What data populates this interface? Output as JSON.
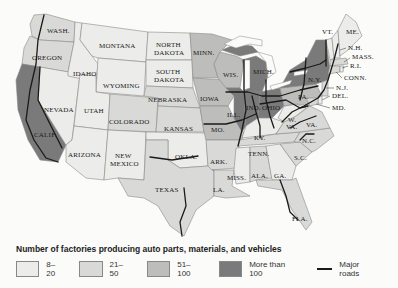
{
  "map": {
    "title": "Number of factories producing auto parts, materials, and vehicles",
    "states": [
      {
        "id": "WA",
        "label": "WASH.",
        "class": "21-50"
      },
      {
        "id": "OR",
        "label": "OREGON",
        "class": "21-50"
      },
      {
        "id": "CA",
        "label": "CALIF.",
        "class": "More than 100"
      },
      {
        "id": "NV",
        "label": "NEVADA",
        "class": "8-20"
      },
      {
        "id": "ID",
        "label": "IDAHO",
        "class": "8-20"
      },
      {
        "id": "MT",
        "label": "MONTANA",
        "class": "8-20"
      },
      {
        "id": "WY",
        "label": "WYOMING",
        "class": "8-20"
      },
      {
        "id": "UT",
        "label": "UTAH",
        "class": "8-20"
      },
      {
        "id": "AZ",
        "label": "ARIZONA",
        "class": "8-20"
      },
      {
        "id": "CO",
        "label": "COLORADO",
        "class": "21-50"
      },
      {
        "id": "NM",
        "label": "NEW MEXICO",
        "class": "8-20"
      },
      {
        "id": "ND",
        "label": "NORTH DAKOTA",
        "class": "8-20"
      },
      {
        "id": "SD",
        "label": "SOUTH DAKOTA",
        "class": "8-20"
      },
      {
        "id": "NE",
        "label": "NEBRASKA",
        "class": "21-50"
      },
      {
        "id": "KS",
        "label": "KANSAS",
        "class": "21-50"
      },
      {
        "id": "OK",
        "label": "OKLA.",
        "class": "8-20"
      },
      {
        "id": "TX",
        "label": "TEXAS",
        "class": "21-50"
      },
      {
        "id": "MN",
        "label": "MINN.",
        "class": "51-100"
      },
      {
        "id": "IA",
        "label": "IOWA",
        "class": "51-100"
      },
      {
        "id": "MO",
        "label": "MO.",
        "class": "51-100"
      },
      {
        "id": "AR",
        "label": "ARK.",
        "class": "21-50"
      },
      {
        "id": "LA",
        "label": "LA.",
        "class": "21-50"
      },
      {
        "id": "WI",
        "label": "WIS.",
        "class": "51-100"
      },
      {
        "id": "IL",
        "label": "ILL.",
        "class": "More than 100"
      },
      {
        "id": "MI",
        "label": "MICH.",
        "class": "More than 100"
      },
      {
        "id": "IN",
        "label": "IND.",
        "class": "More than 100"
      },
      {
        "id": "OH",
        "label": "OHIO",
        "class": "More than 100"
      },
      {
        "id": "KY",
        "label": "KY.",
        "class": "8-20"
      },
      {
        "id": "TN",
        "label": "TENN.",
        "class": "21-50"
      },
      {
        "id": "MS",
        "label": "MISS.",
        "class": "8-20"
      },
      {
        "id": "AL",
        "label": "ALA.",
        "class": "21-50"
      },
      {
        "id": "GA",
        "label": "GA.",
        "class": "8-20"
      },
      {
        "id": "FL",
        "label": "FLA.",
        "class": "21-50"
      },
      {
        "id": "SC",
        "label": "S.C.",
        "class": "21-50"
      },
      {
        "id": "NC",
        "label": "N.C.",
        "class": "21-50"
      },
      {
        "id": "VA",
        "label": "VA.",
        "class": "21-50"
      },
      {
        "id": "WV",
        "label": "W. VA.",
        "class": "8-20"
      },
      {
        "id": "PA",
        "label": "PA.",
        "class": "51-100"
      },
      {
        "id": "NY",
        "label": "N.Y.",
        "class": "More than 100"
      },
      {
        "id": "VT",
        "label": "VT.",
        "class": "8-20"
      },
      {
        "id": "ME",
        "label": "ME.",
        "class": "8-20"
      },
      {
        "id": "NH",
        "label": "N.H.",
        "class": "8-20"
      },
      {
        "id": "MA",
        "label": "MASS.",
        "class": "21-50"
      },
      {
        "id": "RI",
        "label": "R.I.",
        "class": "8-20"
      },
      {
        "id": "CT",
        "label": "CONN.",
        "class": "21-50"
      },
      {
        "id": "NJ",
        "label": "N.J.",
        "class": "21-50"
      },
      {
        "id": "DE",
        "label": "DEL.",
        "class": "8-20"
      },
      {
        "id": "MD",
        "label": "MD.",
        "class": "21-50"
      }
    ]
  },
  "legend": {
    "title": "Number of factories producing auto parts, materials, and vehicles",
    "items": [
      {
        "label": "8–20",
        "color": "#ececea"
      },
      {
        "label": "21–50",
        "color": "#d9d9d7"
      },
      {
        "label": "51–100",
        "color": "#bdbdbb"
      },
      {
        "label": "More than 100",
        "color": "#7a7a7a"
      }
    ],
    "roads_label": "Major roads"
  },
  "labels": {
    "WA": "WASH.",
    "OR": "OREGON",
    "CA": "CALIF.",
    "NV": "NEVADA",
    "ID": "IDAHO",
    "MT": "MONTANA",
    "WY": "WYOMING",
    "UT": "UTAH",
    "AZ": "ARIZONA",
    "CO": "COLORADO",
    "NM1": "NEW",
    "NM2": "MEXICO",
    "ND1": "NORTH",
    "ND2": "DAKOTA",
    "SD1": "SOUTH",
    "SD2": "DAKOTA",
    "NE": "NEBRASKA",
    "KS": "KANSAS",
    "OK": "OKLA.",
    "TX": "TEXAS",
    "MN": "MINN.",
    "IA": "IOWA",
    "MO": "MO.",
    "AR": "ARK.",
    "LA": "LA.",
    "WI": "WIS.",
    "IL": "ILL.",
    "MI": "MICH.",
    "IN": "IND.",
    "OH": "OHIO",
    "KY": "KY.",
    "TN": "TENN.",
    "MS": "MISS.",
    "AL": "ALA.",
    "GA": "GA.",
    "FL": "FLA.",
    "SC": "S.C.",
    "NC": "N.C.",
    "VA": "VA.",
    "WV1": "W.",
    "WV2": "VA.",
    "PA": "PA.",
    "NY": "N.Y.",
    "VT": "VT.",
    "ME": "ME.",
    "NH": "N.H.",
    "MA": "MASS.",
    "RI": "R.I.",
    "CT": "CONN.",
    "NJ": "N.J.",
    "DE": "DEL.",
    "MD": "MD."
  }
}
